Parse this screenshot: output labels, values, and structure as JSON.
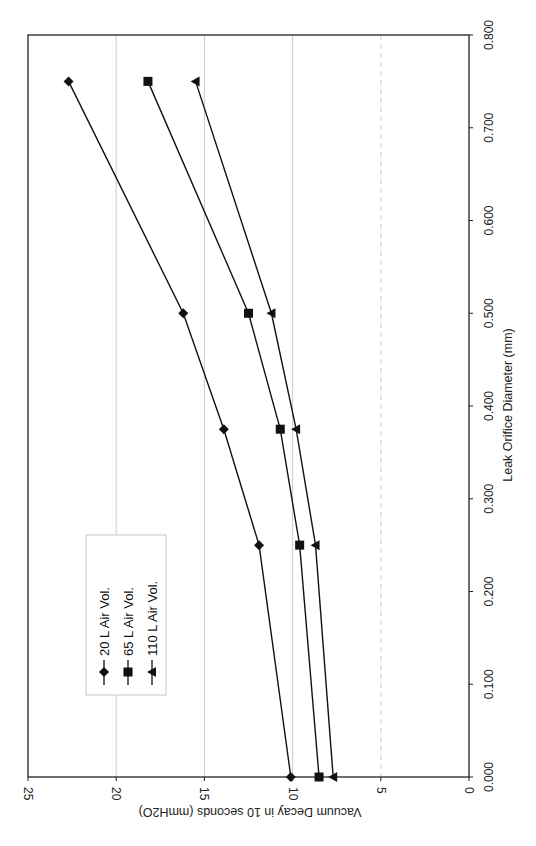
{
  "chart_data": {
    "type": "line",
    "orientation": "rotated-90-ccw",
    "title": "",
    "xlabel": "Leak Orifice Diameter (mm)",
    "ylabel": "Vacuum Decay in 10 seconds (mmH2O)",
    "xlim": [
      0,
      0.8
    ],
    "ylim": [
      0,
      25
    ],
    "x_ticks": [
      "0.000",
      "0.100",
      "0.200",
      "0.300",
      "0.400",
      "0.500",
      "0.600",
      "0.700",
      "0.800"
    ],
    "y_ticks": [
      "0",
      "5",
      "10",
      "15",
      "20",
      "25"
    ],
    "grid": "major horizontal gridlines at 5, 10, 15, 20",
    "legend_position": "inside plot, lower left (in rotated view)",
    "x": [
      0.0,
      0.25,
      0.375,
      0.5,
      0.75
    ],
    "series": [
      {
        "name": "20 L Air Vol.",
        "marker": "diamond",
        "values": [
          10.1,
          11.9,
          13.9,
          16.2,
          22.7
        ]
      },
      {
        "name": "65 L Air Vol.",
        "marker": "square",
        "values": [
          8.5,
          9.6,
          10.7,
          12.5,
          18.2
        ]
      },
      {
        "name": "110 L Air Vol.",
        "marker": "triangle",
        "values": [
          7.7,
          8.7,
          9.8,
          11.2,
          15.5
        ]
      }
    ]
  },
  "colors": {
    "line": "#111111",
    "grid": "#bdbdbd",
    "frame": "#222222"
  }
}
